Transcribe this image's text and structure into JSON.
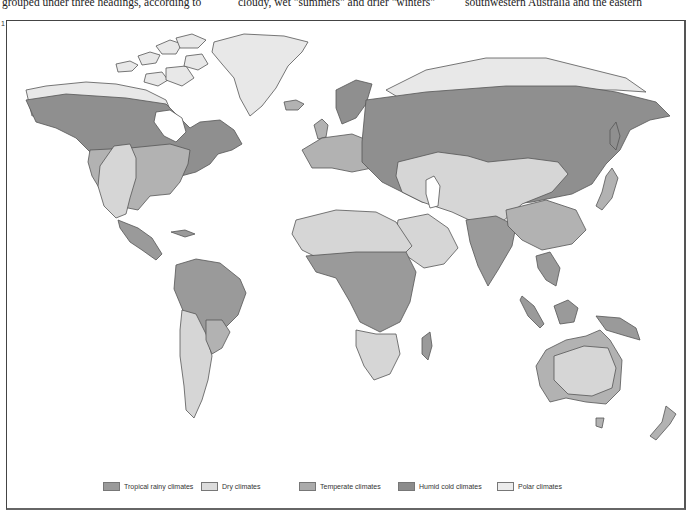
{
  "page": {
    "header_text": [
      "grouped under three headings, according to",
      "cloudy, wet \"summers\" and drier \"winters\"",
      "southwestern   Australia   and   the   eastern"
    ],
    "figure_number": "1"
  },
  "map": {
    "title": "World climate regions",
    "colors": {
      "tropical_rainy": "#9a9a9a",
      "dry": "#d6d6d6",
      "temperate": "#b2b2b2",
      "humid_cold": "#8f8f8f",
      "polar": "#e8e8e8",
      "ocean": "#ffffff",
      "coastline": "#555555"
    }
  },
  "legend": {
    "items": [
      {
        "key": "tropical_rainy",
        "label": "Tropical rainy climates",
        "color": "#9a9a9a"
      },
      {
        "key": "dry",
        "label": "Dry climates",
        "color": "#dcdcdc"
      },
      {
        "key": "temperate",
        "label": "Temperate climates",
        "color": "#ababab"
      },
      {
        "key": "humid_cold",
        "label": "Humid cold climates",
        "color": "#8c8c8c"
      },
      {
        "key": "polar",
        "label": "Polar climates",
        "color": "#ececec"
      }
    ]
  }
}
